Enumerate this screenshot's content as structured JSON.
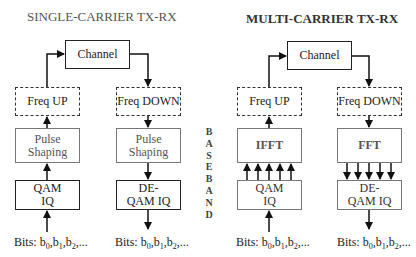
{
  "single_carrier": {
    "title": "SINGLE-CARRIER TX-RX",
    "channel": "Channel",
    "freq_up": "Freq UP",
    "freq_down": "Freq DOWN",
    "tx_pulse_shaping": "Pulse Shaping",
    "rx_pulse_shaping": "Pulse Shaping",
    "qam": "QAM IQ",
    "de_qam": "DE-QAM IQ",
    "tx_bits": "Bits: b0,b1,b2,...",
    "rx_bits": "Bits: b0,b1,b2,..."
  },
  "baseband_label": "BASEBAND",
  "multi_carrier": {
    "title": "MULTI-CARRIER TX-RX",
    "channel": "Channel",
    "freq_up": "Freq UP",
    "freq_down": "Freq DOWN",
    "ifft": "IFFT",
    "fft": "FFT",
    "qam": "QAM IQ",
    "de_qam": "DE-QAM IQ",
    "tx_bits": "Bits: b0,b1,b2,...",
    "rx_bits": "Bits: b0,b1,b2,..."
  },
  "bits_prefix": "Bits:",
  "bits_symbols": [
    "b",
    "0",
    "b",
    "1",
    "b",
    "2"
  ],
  "colors": {
    "solid_border": "#222222",
    "light_border": "#777777",
    "light_text": "#555555",
    "background": "#ffffff"
  }
}
